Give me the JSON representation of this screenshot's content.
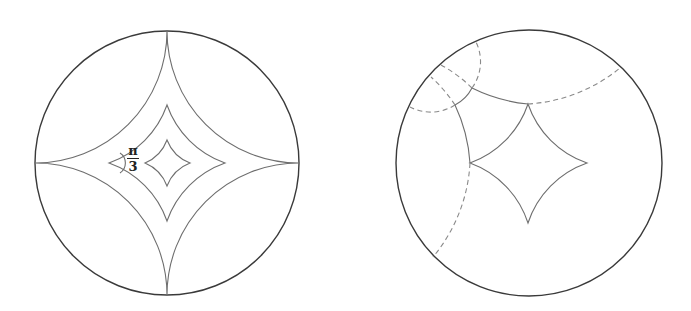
{
  "figure": {
    "left_panel": {
      "description": "Hyperbolic disk with nested regular ideal/finite quadrilaterals",
      "angle_label": {
        "numerator": "π",
        "denominator": "3"
      }
    },
    "right_panel": {
      "description": "Hyperbolic disk with quadrilateral and dashed geodesic extensions"
    }
  },
  "colors": {
    "boundary": "#3a3a3a",
    "geodesic": "#6e6e6e",
    "dashed": "#8a8a8a"
  }
}
